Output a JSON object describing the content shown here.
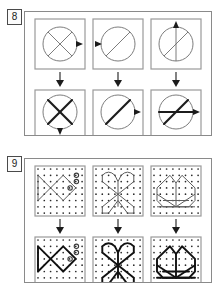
{
  "page": {
    "width": 221,
    "height": 294,
    "background": "#ffffff",
    "ink": "#1c1c1c",
    "thin_ink": "#6e6e6e",
    "frame_color": "#8a8a8a"
  },
  "puzzles": [
    {
      "number": "8",
      "type": "circle-transformation-sequence",
      "frame": {
        "x": 24,
        "y": 11,
        "width": 188,
        "height": 125
      },
      "rows": 2,
      "cols": 3,
      "cells": [
        {
          "id": "p8-top-left",
          "row": "top",
          "col": 1,
          "description": "circle with thin X (two diagonals), small triangle marker on right edge pointing right",
          "circle": {
            "cx": 30,
            "cy": 30,
            "r": 20
          },
          "line_weight": "thin",
          "chords": [
            "diagonal-nw-se",
            "diagonal-sw-ne"
          ],
          "marker": {
            "position": "right",
            "direction": "right"
          }
        },
        {
          "id": "p8-top-middle",
          "row": "top",
          "col": 2,
          "description": "circle with thin single diagonal from bottom-left to top-right, small triangle marker on left edge pointing left",
          "circle": {
            "cx": 30,
            "cy": 30,
            "r": 20
          },
          "line_weight": "thin",
          "chords": [
            "diagonal-sw-ne"
          ],
          "marker": {
            "position": "left",
            "direction": "left"
          }
        },
        {
          "id": "p8-top-right",
          "row": "top",
          "col": 3,
          "description": "circle with thin vertical line and thin diagonal from bottom-left to top-right, small triangle marker on top edge pointing up",
          "circle": {
            "cx": 30,
            "cy": 30,
            "r": 20
          },
          "line_weight": "thin",
          "chords": [
            "vertical",
            "diagonal-sw-ne"
          ],
          "marker": {
            "position": "top",
            "direction": "up"
          }
        },
        {
          "id": "p8-bottom-left",
          "row": "bottom",
          "col": 1,
          "description": "circle with bold X (two diagonals), small triangle marker on bottom edge pointing down",
          "circle": {
            "cx": 30,
            "cy": 30,
            "r": 20
          },
          "line_weight": "bold",
          "chords": [
            "diagonal-nw-se",
            "diagonal-sw-ne"
          ],
          "marker": {
            "position": "bottom",
            "direction": "down"
          }
        },
        {
          "id": "p8-bottom-middle",
          "row": "bottom",
          "col": 2,
          "description": "circle with bold single diagonal from bottom-left to top-right, small triangle marker on right edge pointing right",
          "circle": {
            "cx": 30,
            "cy": 30,
            "r": 20
          },
          "line_weight": "bold",
          "chords": [
            "diagonal-sw-ne"
          ],
          "marker": {
            "position": "right",
            "direction": "right"
          }
        },
        {
          "id": "p8-bottom-right",
          "row": "bottom",
          "col": 3,
          "description": "circle with bold diagonal from bottom-left to top-right plus bold horizontal line, small triangle marker on right edge pointing right",
          "circle": {
            "cx": 30,
            "cy": 30,
            "r": 20
          },
          "line_weight": "bold",
          "chords": [
            "diagonal-sw-ne",
            "horizontal"
          ],
          "marker": {
            "position": "right",
            "direction": "right"
          }
        }
      ],
      "arrows": [
        {
          "id": "p8-arrow-1",
          "from": "p8-top-left",
          "to": "p8-bottom-left",
          "direction": "down"
        },
        {
          "id": "p8-arrow-2",
          "from": "p8-top-middle",
          "to": "p8-bottom-middle",
          "direction": "down"
        },
        {
          "id": "p8-arrow-3",
          "from": "p8-top-right",
          "to": "p8-bottom-right",
          "direction": "down"
        }
      ]
    },
    {
      "number": "9",
      "type": "dot-grid-figure-sequence",
      "frame": {
        "x": 24,
        "y": 11,
        "width": 188,
        "height": 125
      },
      "rows": 2,
      "cols": 3,
      "grid": {
        "dots_x": 8,
        "dots_y": 8,
        "spacing": 6.2
      },
      "cells": [
        {
          "id": "p9-top-left",
          "row": "top",
          "col": 1,
          "figure": "fish",
          "line_weight": "thin",
          "description": "fish: diamond body with triangular tail on the left, two circled dots (eye markers) upper right and one circled dot at centre-right"
        },
        {
          "id": "p9-top-middle",
          "row": "top",
          "col": 2,
          "figure": "butterfly",
          "line_weight": "thin",
          "description": "butterfly: two upper scalloped wings meeting at centre with a V, two lower wings forming an X shape below"
        },
        {
          "id": "p9-top-right",
          "row": "top",
          "col": 3,
          "figure": "boat",
          "line_weight": "thin",
          "description": "boat/crown: two pointed peaks over a body with crossed diagonals and a horizontal base line"
        },
        {
          "id": "p9-bottom-left",
          "row": "bottom",
          "col": 1,
          "figure": "fish",
          "line_weight": "bold",
          "description": "same fish figure drawn with bold strokes"
        },
        {
          "id": "p9-bottom-middle",
          "row": "bottom",
          "col": 2,
          "figure": "butterfly",
          "line_weight": "bold",
          "description": "same butterfly figure drawn with bold strokes"
        },
        {
          "id": "p9-bottom-right",
          "row": "bottom",
          "col": 3,
          "figure": "boat",
          "line_weight": "bold",
          "description": "same boat/crown figure drawn with bold strokes"
        }
      ],
      "arrows": [
        {
          "id": "p9-arrow-1",
          "from": "p9-top-left",
          "to": "p9-bottom-left",
          "direction": "down"
        },
        {
          "id": "p9-arrow-2",
          "from": "p9-top-middle",
          "to": "p9-bottom-middle",
          "direction": "down"
        },
        {
          "id": "p9-arrow-3",
          "from": "p9-top-right",
          "to": "p9-bottom-right",
          "direction": "down"
        }
      ]
    }
  ]
}
